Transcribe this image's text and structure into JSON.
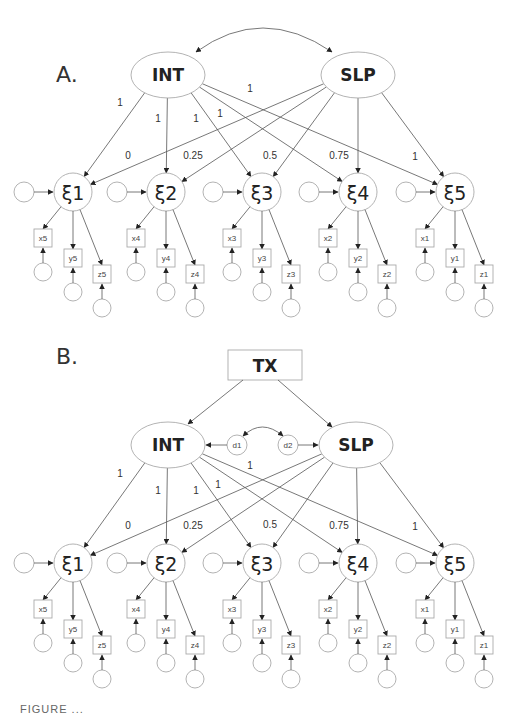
{
  "panels": [
    {
      "label": "A.",
      "latents": {
        "int": "INT",
        "slp": "SLP"
      },
      "factors": [
        "ξ1",
        "ξ2",
        "ξ3",
        "ξ4",
        "ξ5"
      ],
      "int_loadings": [
        "1",
        "1",
        "1",
        "1",
        "1"
      ],
      "slp_loadings": [
        "0",
        "0.25",
        "0.5",
        "0.75",
        "1"
      ],
      "indicators": [
        [
          "x5",
          "y5",
          "z5"
        ],
        [
          "x4",
          "y4",
          "z4"
        ],
        [
          "x3",
          "y3",
          "z3"
        ],
        [
          "x2",
          "y2",
          "z2"
        ],
        [
          "x1",
          "y1",
          "z1"
        ]
      ],
      "covariance": "INT <-> SLP"
    },
    {
      "label": "B.",
      "predictor": "TX",
      "disturbances": [
        "d1",
        "d2"
      ],
      "latents": {
        "int": "INT",
        "slp": "SLP"
      },
      "factors": [
        "ξ1",
        "ξ2",
        "ξ3",
        "ξ4",
        "ξ5"
      ],
      "int_loadings": [
        "1",
        "1",
        "1",
        "1",
        "1"
      ],
      "slp_loadings": [
        "0",
        "0.25",
        "0.5",
        "0.75",
        "1"
      ],
      "indicators": [
        [
          "x5",
          "y5",
          "z5"
        ],
        [
          "x4",
          "y4",
          "z4"
        ],
        [
          "x3",
          "y3",
          "z3"
        ],
        [
          "x2",
          "y2",
          "z2"
        ],
        [
          "x1",
          "y1",
          "z1"
        ]
      ],
      "covariance": "d1 <-> d2"
    }
  ],
  "caption": "FIGURE ..."
}
